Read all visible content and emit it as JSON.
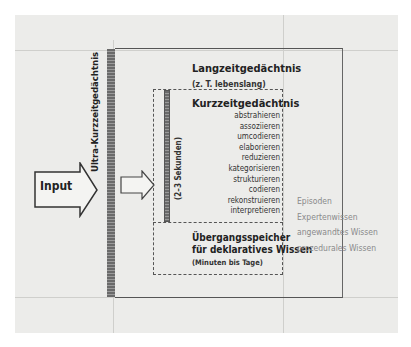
{
  "diagram": {
    "type": "memory-model",
    "input": {
      "label": "Input"
    },
    "ultra_short_term": {
      "label": "Ultra-Kurzzeitgedächtnis"
    },
    "long_term": {
      "title": "Langzeitgedächtnis",
      "subtitle": "(z. T. lebenslang)",
      "contents": [
        "Episoden",
        "Expertenwissen",
        "angewandtes Wissen",
        "prozedurales Wissen"
      ]
    },
    "short_term": {
      "title": "Kurzzeitgedächtnis",
      "duration": "(2–3 Sekunden)",
      "processes": [
        "abstrahieren",
        "assoziieren",
        "umcodieren",
        "elaborieren",
        "reduzieren",
        "kategorisieren",
        "strukturieren",
        "codieren",
        "rekonstruieren",
        "interpretieren"
      ]
    },
    "transition": {
      "title_line1": "Übergangsspeicher",
      "title_line2": "für deklaratives Wissen",
      "subtitle": "(Minuten bis Tage)"
    }
  }
}
